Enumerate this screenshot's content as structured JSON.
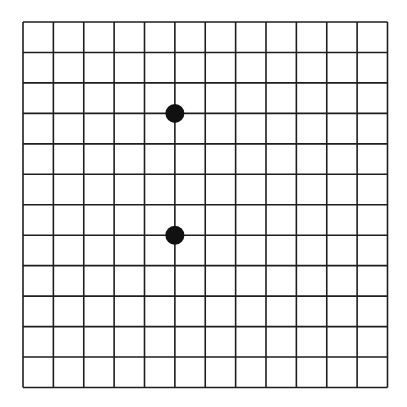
{
  "board": {
    "lines": 13,
    "cells": 12,
    "origin": {
      "x": 23,
      "y": 22
    },
    "end": {
      "x": 387.5,
      "y": 387.5
    },
    "line_color": "#1e1e1e",
    "background": "#ffffff"
  },
  "stones": [
    {
      "color": "black",
      "col": 5,
      "row": 3,
      "fill": "#111111"
    },
    {
      "color": "black",
      "col": 5,
      "row": 7,
      "fill": "#111111"
    }
  ]
}
